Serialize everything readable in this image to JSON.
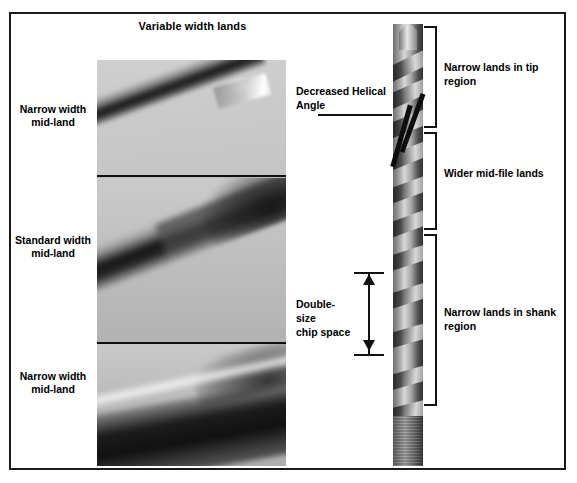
{
  "figure": {
    "title": "Variable width lands",
    "border_color": "#1a1a1a",
    "background_color": "#ffffff"
  },
  "left_column": {
    "panels": [
      {
        "label_line_1": "Narrow width",
        "label_line_2": "mid-land",
        "caption": "Narrow width mid-land",
        "image_name": "micrograph-narrow-width-mid-land-tip"
      },
      {
        "label_line_1": "Standard width",
        "label_line_2": "mid-land",
        "caption": "Standard width mid-land",
        "image_name": "micrograph-standard-width-mid-land"
      },
      {
        "label_line_1": "Narrow width",
        "label_line_2": "mid-land",
        "caption": "Narrow width mid-land",
        "image_name": "micrograph-narrow-width-mid-land"
      }
    ]
  },
  "right_column": {
    "drill_image_name": "twist-drill-full-length-photo",
    "brackets": [
      {
        "name": "tip-region",
        "label": "Narrow lands in tip region"
      },
      {
        "name": "mid-file-region",
        "label": "Wider mid-file lands"
      },
      {
        "name": "shank-region",
        "label": "Narrow lands in shank region"
      }
    ],
    "callouts": [
      {
        "name": "decreased-helical-angle",
        "line_1": "Decreased Helical",
        "line_2": "Angle"
      },
      {
        "name": "double-size-chip-space",
        "line_1": "Double-size",
        "line_2": "chip space"
      }
    ]
  }
}
